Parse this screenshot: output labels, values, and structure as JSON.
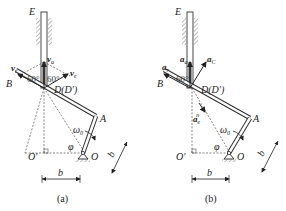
{
  "figures": [
    {
      "id": "a",
      "caption": "(a)",
      "points": {
        "E": "E",
        "B": "B",
        "D": "D(D′)",
        "A": "A",
        "O": "O",
        "O_prime": "O′"
      },
      "vectors": {
        "va": "v",
        "va_sub": "a",
        "vr": "v",
        "vr_sub": "r",
        "ve": "v",
        "ve_sub": "e"
      },
      "angles": {
        "left": "60°",
        "right": "60°",
        "phi": "φ"
      },
      "omega": "ω",
      "omega_sub": "0",
      "dims": {
        "horizontal": "b",
        "slanted": "b"
      }
    },
    {
      "id": "b",
      "caption": "(b)",
      "points": {
        "E": "E",
        "B": "B",
        "D": "D(D′)",
        "A": "A",
        "O": "O",
        "O_prime": "O′"
      },
      "vectors": {
        "aa": "a",
        "aa_sub": "a",
        "ar": "a",
        "ar_sub": "r",
        "aC": "a",
        "aC_sub": "C",
        "aen": "a",
        "aen_sub": "e",
        "aen_sup": "n"
      },
      "angles": {
        "left": "60°",
        "phi": "φ"
      },
      "omega": "ω",
      "omega_sub": "0",
      "dims": {
        "horizontal": "b",
        "slanted": "b"
      }
    }
  ]
}
